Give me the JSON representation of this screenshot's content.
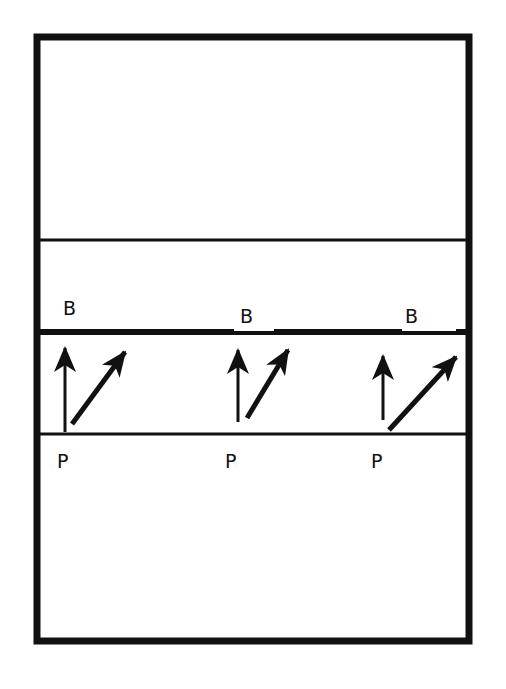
{
  "diagram": {
    "colors": {
      "ink": "#111111",
      "background": "#ffffff"
    },
    "frame": {
      "x": 34,
      "y": 34,
      "w": 438,
      "h": 610
    },
    "lines": {
      "upper_thin": {
        "y": 240
      },
      "thick_boundary": {
        "y": 332
      },
      "lower_thin": {
        "y": 434
      }
    },
    "groups": [
      {
        "top_label": "B",
        "bottom_label": "P",
        "top_label_pos": [
          65,
          300
        ],
        "bottom_label_pos": [
          58,
          453
        ]
      },
      {
        "top_label": "B",
        "bottom_label": "P",
        "top_label_pos": [
          240,
          308
        ],
        "bottom_label_pos": [
          226,
          453
        ]
      },
      {
        "top_label": "B",
        "bottom_label": "P",
        "top_label_pos": [
          405,
          308
        ],
        "bottom_label_pos": [
          372,
          453
        ]
      }
    ],
    "arrows": [
      {
        "name": "vertical-arrow-1",
        "x1": 64,
        "y1": 432,
        "x2": 64,
        "y2": 348
      },
      {
        "name": "diagonal-arrow-1",
        "x1": 72,
        "y1": 424,
        "x2": 125,
        "y2": 352
      },
      {
        "name": "vertical-arrow-2",
        "x1": 238,
        "y1": 422,
        "x2": 238,
        "y2": 350
      },
      {
        "name": "diagonal-arrow-2",
        "x1": 247,
        "y1": 418,
        "x2": 288,
        "y2": 350
      },
      {
        "name": "vertical-arrow-3",
        "x1": 383,
        "y1": 420,
        "x2": 383,
        "y2": 356
      },
      {
        "name": "diagonal-arrow-3",
        "x1": 389,
        "y1": 430,
        "x2": 456,
        "y2": 357
      }
    ]
  }
}
